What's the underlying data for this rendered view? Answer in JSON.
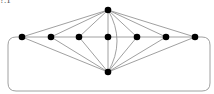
{
  "figure": {
    "label": "?.1",
    "node_color": "#000000",
    "edge_color": "#888888",
    "node_radius": 3.3,
    "nodes": [
      {
        "id": "top",
        "x": 108,
        "y": 10
      },
      {
        "id": "r1",
        "x": 22,
        "y": 37
      },
      {
        "id": "r2",
        "x": 51,
        "y": 37
      },
      {
        "id": "r3",
        "x": 79,
        "y": 37
      },
      {
        "id": "r4",
        "x": 108,
        "y": 37
      },
      {
        "id": "r5",
        "x": 137,
        "y": 37
      },
      {
        "id": "r6",
        "x": 166,
        "y": 37
      },
      {
        "id": "r7",
        "x": 195,
        "y": 37
      },
      {
        "id": "bottom",
        "x": 108,
        "y": 72
      }
    ],
    "edges": [
      [
        "top",
        "r1"
      ],
      [
        "top",
        "r2"
      ],
      [
        "top",
        "r3"
      ],
      [
        "top",
        "r4"
      ],
      [
        "top",
        "r5"
      ],
      [
        "top",
        "r6"
      ],
      [
        "top",
        "r7"
      ],
      [
        "bottom",
        "r1"
      ],
      [
        "bottom",
        "r2"
      ],
      [
        "bottom",
        "r3"
      ],
      [
        "bottom",
        "r4"
      ],
      [
        "bottom",
        "r5"
      ],
      [
        "bottom",
        "r6"
      ],
      [
        "bottom",
        "r7"
      ],
      [
        "r1",
        "r2"
      ],
      [
        "r2",
        "r3"
      ],
      [
        "r3",
        "r4"
      ],
      [
        "r4",
        "r5"
      ],
      [
        "r5",
        "r6"
      ],
      [
        "r6",
        "r7"
      ]
    ],
    "curved_edge": {
      "from": "top",
      "to": "bottom"
    },
    "outer_loop": {
      "from": "r1",
      "to": "r7",
      "x1": 8,
      "x2": 210,
      "y_bottom": 91
    }
  }
}
